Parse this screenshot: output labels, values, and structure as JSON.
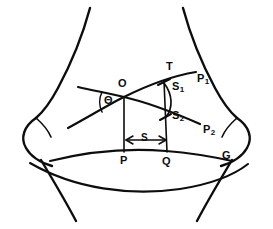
{
  "figure": {
    "caption": "",
    "labels": {
      "center_point": "O",
      "angle": "Θ",
      "tangent_point": "T",
      "station_1": "S",
      "station_1_sub": "1",
      "station_2": "S",
      "station_2_sub": "2",
      "path_1": "P",
      "path_1_sub": "1",
      "path_2": "P",
      "path_2_sub": "2",
      "base_left": "P",
      "base_mid": "Q",
      "base_right": "G",
      "spacing": "S"
    }
  },
  "geometry": {
    "points": {
      "O": [
        124,
        97
      ],
      "T": [
        166,
        80
      ],
      "S1": [
        164,
        84
      ],
      "S2": [
        165,
        117
      ],
      "P": [
        124,
        154
      ],
      "Q": [
        166,
        155
      ],
      "G": [
        225,
        155
      ]
    },
    "angle_theta_deg": 38,
    "spacing_S_px": 42
  },
  "style": {
    "ink": "#0d0d0d",
    "paper": "#ffffff"
  }
}
